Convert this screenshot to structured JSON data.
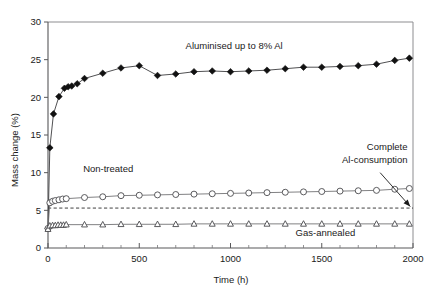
{
  "chart_data": {
    "type": "line",
    "title": "",
    "xlabel": "Time (h)",
    "ylabel": "Mass change (%)",
    "xlim": [
      0,
      2000
    ],
    "ylim": [
      0,
      30
    ],
    "xticks": [
      0,
      500,
      1000,
      1500,
      2000
    ],
    "xtick_labels": [
      "0",
      "500",
      "1000",
      "1500",
      "2000"
    ],
    "x_minor_interval": 100,
    "yticks": [
      0,
      5,
      10,
      15,
      20,
      25,
      30
    ],
    "ytick_labels": [
      "0",
      "5",
      "10",
      "15",
      "20",
      "25",
      "30"
    ],
    "grid": false,
    "legend_position": "inline-annotations",
    "series": [
      {
        "name": "Aluminised up to 8% Al",
        "marker": "filled-diamond",
        "marker_color": "#111111",
        "line_color": "#3c3c3e",
        "x": [
          0,
          10,
          30,
          60,
          90,
          110,
          130,
          160,
          200,
          300,
          400,
          500,
          600,
          700,
          800,
          900,
          1000,
          1100,
          1200,
          1300,
          1400,
          1500,
          1600,
          1700,
          1800,
          1900,
          1980
        ],
        "y": [
          2.6,
          13.3,
          17.8,
          20.1,
          21.2,
          21.4,
          21.5,
          21.8,
          22.5,
          23.2,
          23.9,
          24.2,
          22.9,
          23.1,
          23.4,
          23.5,
          23.4,
          23.5,
          23.6,
          23.8,
          24.0,
          24.0,
          24.1,
          24.2,
          24.4,
          24.9,
          25.2
        ]
      },
      {
        "name": "Non-treated",
        "marker": "open-circle",
        "marker_color": "#ffffff",
        "line_color": "#6a6a6d",
        "x": [
          0,
          10,
          25,
          40,
          60,
          80,
          100,
          200,
          300,
          400,
          500,
          600,
          700,
          800,
          900,
          1000,
          1100,
          1200,
          1300,
          1400,
          1500,
          1600,
          1700,
          1800,
          1900,
          1980
        ],
        "y": [
          2.6,
          6.0,
          6.2,
          6.3,
          6.4,
          6.5,
          6.55,
          6.7,
          6.8,
          6.95,
          7.0,
          7.05,
          7.1,
          7.15,
          7.2,
          7.25,
          7.3,
          7.35,
          7.4,
          7.45,
          7.5,
          7.55,
          7.6,
          7.65,
          7.8,
          7.9
        ]
      },
      {
        "name": "Gas-annealed",
        "marker": "open-triangle",
        "marker_color": "#ffffff",
        "line_color": "#6a6a6d",
        "x": [
          0,
          10,
          25,
          40,
          55,
          70,
          85,
          100,
          200,
          300,
          400,
          500,
          600,
          700,
          800,
          900,
          1000,
          1100,
          1200,
          1300,
          1400,
          1500,
          1600,
          1700,
          1800,
          1900,
          1980
        ],
        "y": [
          2.5,
          2.95,
          3.0,
          3.0,
          3.05,
          3.05,
          3.05,
          3.1,
          3.1,
          3.1,
          3.15,
          3.15,
          3.15,
          3.15,
          3.2,
          3.2,
          3.2,
          3.2,
          3.2,
          3.2,
          3.2,
          3.2,
          3.2,
          3.2,
          3.2,
          3.2,
          3.2
        ]
      }
    ],
    "reference_line": {
      "label": "Complete Al-consumption",
      "value": 5.3,
      "style": "dashed",
      "orientation": "horizontal"
    },
    "annotations": [
      {
        "id": "aluminised-label",
        "text": "Aluminised up to 8% Al",
        "x": 1020,
        "y": 26.4
      },
      {
        "id": "non-treated-label",
        "text": "Non-treated",
        "x": 330,
        "y": 10.1
      },
      {
        "id": "gas-annealed-label",
        "text": "Gas-annealed",
        "x": 1520,
        "y": 1.55
      },
      {
        "id": "complete-consumption-line1",
        "text": "Complete",
        "x": 1970,
        "y": 13.0
      },
      {
        "id": "complete-consumption-line2",
        "text": "Al-consumption",
        "x": 1970,
        "y": 11.3
      }
    ]
  }
}
